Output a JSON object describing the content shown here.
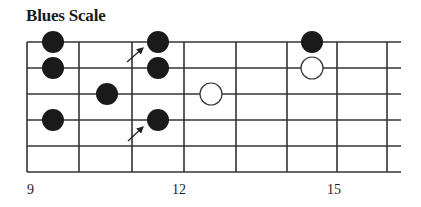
{
  "title": "Blues Scale",
  "diagram": {
    "type": "guitar-fretboard",
    "strings": 6,
    "string_y": [
      42,
      68,
      94,
      120,
      146,
      172
    ],
    "fret_x": [
      27,
      79,
      132,
      184,
      236,
      287,
      337,
      387
    ],
    "string_end_x": 401,
    "line_color": "#333333",
    "dot_color": "#1a1a1a",
    "dot_radius": 11,
    "filled_notes": [
      {
        "x": 53,
        "string": 1
      },
      {
        "x": 53,
        "string": 2
      },
      {
        "x": 53,
        "string": 4
      },
      {
        "x": 107,
        "string": 3
      },
      {
        "x": 158,
        "string": 1
      },
      {
        "x": 158,
        "string": 2
      },
      {
        "x": 158,
        "string": 4
      },
      {
        "x": 312,
        "string": 1
      }
    ],
    "hollow_notes": [
      {
        "x": 211,
        "string": 3
      },
      {
        "x": 312,
        "string": 2
      }
    ],
    "arrows": [
      {
        "from": [
          127,
          62
        ],
        "to": [
          143,
          48
        ]
      },
      {
        "from": [
          128,
          141
        ],
        "to": [
          143,
          127
        ]
      }
    ]
  },
  "fret_labels": [
    {
      "text": "9",
      "x": 27
    },
    {
      "text": "12",
      "x": 172
    },
    {
      "text": "15",
      "x": 327
    }
  ]
}
